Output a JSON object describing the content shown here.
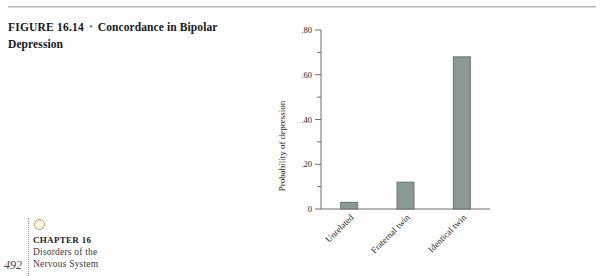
{
  "caption": {
    "figure_number": "FIGURE 16.14",
    "bullet": "•",
    "title": "Concordance in Bipolar Depression"
  },
  "footer": {
    "dot_icon": "chapter-dot-icon",
    "chapter_label": "CHAPTER 16",
    "chapter_subtitle_line1": "Disorders of the",
    "chapter_subtitle_line2": "Nervous System",
    "page_number": "492"
  },
  "colors": {
    "bar_fill": "#8a9a92",
    "bar_stroke": "#5e6d66",
    "axis": "#6d6d6d",
    "caption_bullet": "#4a7fb5",
    "rule": "#b9b9b9",
    "chapter_dot": "#c8a05a"
  },
  "chart_data": {
    "type": "bar",
    "title": "Concordance in Bipolar Depression",
    "xlabel": "",
    "ylabel": "Probability of depression",
    "categories": [
      "Unrelated",
      "Fraternal twin",
      "Identical twin"
    ],
    "values": [
      0.03,
      0.12,
      0.68
    ],
    "ylim": [
      0,
      0.8
    ],
    "ytick_labels": [
      "0",
      ".20",
      ".40",
      ".60",
      ".80"
    ],
    "ytick_values": [
      0,
      0.2,
      0.4,
      0.6,
      0.8
    ],
    "yminor_values": [
      0.1,
      0.3,
      0.5,
      0.7
    ],
    "grid": false,
    "legend": "none",
    "category_label_rotation_deg": -45,
    "series": [
      {
        "name": "Probability of depression",
        "values": [
          0.03,
          0.12,
          0.68
        ]
      }
    ]
  }
}
